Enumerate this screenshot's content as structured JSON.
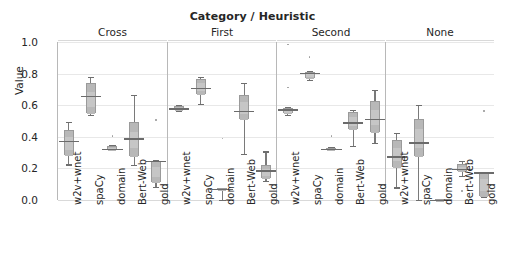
{
  "chart_data": {
    "type": "box",
    "title": "Category / Heuristic",
    "xlabel": "",
    "ylabel": "Value",
    "ylim": [
      0.0,
      1.0
    ],
    "yticks": [
      "0.0",
      "0.2",
      "0.4",
      "0.6",
      "0.8",
      "1.0"
    ],
    "ytick_values": [
      0.0,
      0.2,
      0.4,
      0.6,
      0.8,
      1.0
    ],
    "grid": true,
    "legend": "none",
    "facet_variable": "Category / Heuristic",
    "categories": [
      "w2v+wnet",
      "spaCy",
      "domain",
      "Bert-Web",
      "gold"
    ],
    "panels": [
      {
        "label": "Cross",
        "boxes": [
          {
            "category": "w2v+wnet",
            "whisker_low": 0.225,
            "q1": 0.285,
            "median": 0.375,
            "q3": 0.445,
            "whisker_high": 0.495,
            "fliers": []
          },
          {
            "category": "spaCy",
            "whisker_low": 0.54,
            "q1": 0.55,
            "median": 0.66,
            "q3": 0.74,
            "whisker_high": 0.78,
            "fliers": []
          },
          {
            "category": "domain",
            "whisker_low": 0.315,
            "q1": 0.318,
            "median": 0.325,
            "q3": 0.34,
            "whisker_high": 0.345,
            "fliers": [
              0.405
            ]
          },
          {
            "category": "Bert-Web",
            "whisker_low": 0.22,
            "q1": 0.28,
            "median": 0.392,
            "q3": 0.492,
            "whisker_high": 0.665,
            "fliers": []
          },
          {
            "category": "gold",
            "whisker_low": 0.085,
            "q1": 0.115,
            "median": 0.248,
            "q3": 0.25,
            "whisker_high": 0.255,
            "fliers": [
              0.505
            ]
          }
        ]
      },
      {
        "label": "First",
        "boxes": [
          {
            "category": "w2v+wnet",
            "whisker_low": 0.565,
            "q1": 0.572,
            "median": 0.582,
            "q3": 0.592,
            "whisker_high": 0.6,
            "fliers": []
          },
          {
            "category": "spaCy",
            "whisker_low": 0.61,
            "q1": 0.672,
            "median": 0.712,
            "q3": 0.768,
            "whisker_high": 0.778,
            "fliers": []
          },
          {
            "category": "domain",
            "whisker_low": 0.0,
            "q1": 0.07,
            "median": 0.072,
            "q3": 0.075,
            "whisker_high": 0.078,
            "fliers": [
              0.39
            ]
          },
          {
            "category": "Bert-Web",
            "whisker_low": 0.292,
            "q1": 0.51,
            "median": 0.565,
            "q3": 0.665,
            "whisker_high": 0.742,
            "fliers": []
          },
          {
            "category": "gold",
            "whisker_low": 0.122,
            "q1": 0.14,
            "median": 0.19,
            "q3": 0.222,
            "whisker_high": 0.308,
            "fliers": []
          }
        ]
      },
      {
        "label": "Second",
        "boxes": [
          {
            "category": "w2v+wnet",
            "whisker_low": 0.538,
            "q1": 0.552,
            "median": 0.575,
            "q3": 0.582,
            "whisker_high": 0.588,
            "fliers": [
              0.712,
              0.985
            ]
          },
          {
            "category": "spaCy",
            "whisker_low": 0.762,
            "q1": 0.772,
            "median": 0.805,
            "q3": 0.812,
            "whisker_high": 0.818,
            "fliers": [
              0.905
            ]
          },
          {
            "category": "domain",
            "whisker_low": 0.315,
            "q1": 0.32,
            "median": 0.325,
            "q3": 0.33,
            "whisker_high": 0.335,
            "fliers": [
              0.405
            ]
          },
          {
            "category": "Bert-Web",
            "whisker_low": 0.34,
            "q1": 0.448,
            "median": 0.492,
            "q3": 0.56,
            "whisker_high": 0.572,
            "fliers": []
          },
          {
            "category": "gold",
            "whisker_low": 0.362,
            "q1": 0.432,
            "median": 0.515,
            "q3": 0.628,
            "whisker_high": 0.698,
            "fliers": []
          }
        ]
      },
      {
        "label": "None",
        "boxes": [
          {
            "category": "w2v+wnet",
            "whisker_low": 0.08,
            "q1": 0.208,
            "median": 0.278,
            "q3": 0.378,
            "whisker_high": 0.425,
            "fliers": []
          },
          {
            "category": "spaCy",
            "whisker_low": 0.002,
            "q1": 0.28,
            "median": 0.365,
            "q3": 0.512,
            "whisker_high": 0.6,
            "fliers": []
          },
          {
            "category": "domain",
            "whisker_low": 0.0,
            "q1": 0.0,
            "median": 0.002,
            "q3": 0.004,
            "whisker_high": 0.005,
            "fliers": []
          },
          {
            "category": "Bert-Web",
            "whisker_low": 0.15,
            "q1": 0.182,
            "median": 0.198,
            "q3": 0.228,
            "whisker_high": 0.245,
            "fliers": [
              0.058
            ]
          },
          {
            "category": "gold",
            "whisker_low": 0.018,
            "q1": 0.025,
            "median": 0.175,
            "q3": 0.178,
            "whisker_high": 0.18,
            "fliers": [
              0.565
            ]
          }
        ]
      }
    ],
    "colors": {
      "box_fill": "#bdbdbd",
      "box_edge": "#9a9a9a",
      "median": "#6b6b6b",
      "whisker": "#7a7a7a",
      "grid": "#e8e8e8",
      "axis": "#b8b8b8",
      "text": "#262626",
      "background": "#ffffff"
    }
  }
}
